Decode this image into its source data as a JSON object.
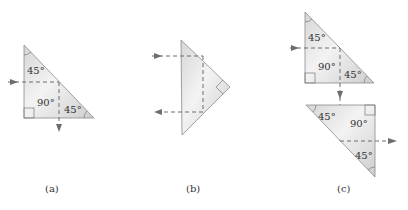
{
  "figure": {
    "panels": [
      {
        "caption": "(a)",
        "angles": {
          "top": "45°",
          "right_angle": "90°",
          "bottom_right": "45°"
        }
      },
      {
        "caption": "(b)"
      },
      {
        "caption": "(c)",
        "upper_angles": {
          "top": "45°",
          "right_angle": "90°",
          "bottom_right": "45°"
        },
        "lower_angles": {
          "top_left": "45°",
          "right_angle": "90°",
          "bottom": "45°"
        }
      }
    ]
  },
  "colors": {
    "prism_fill_light": "#f2f2f2",
    "prism_fill_dark": "#cfcfcf",
    "ray": "#6d6d6d",
    "edge": "#8a8a8a"
  }
}
